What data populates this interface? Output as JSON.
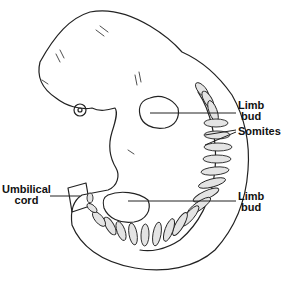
{
  "diagram": {
    "labels": {
      "limb_bud_upper": {
        "line1": "Limb",
        "line2": "bud"
      },
      "somites": "Somites",
      "umbilical_cord": {
        "line1": "Umbilical",
        "line2": "cord"
      },
      "limb_bud_lower": {
        "line1": "Limb",
        "line2": "bud"
      }
    },
    "colors": {
      "line": "#222222",
      "somite_fill": "#e4e4e4",
      "background": "#ffffff"
    }
  }
}
